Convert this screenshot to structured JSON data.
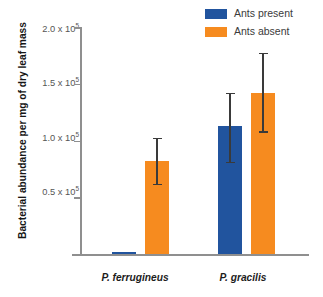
{
  "chart_data": {
    "type": "bar",
    "title": "",
    "xlabel": "",
    "ylabel": "Bacterial abundance per mg of dry leaf mass",
    "categories": [
      "P. ferrugineus",
      "P. gracilis"
    ],
    "ylim": [
      0,
      200000
    ],
    "grid": false,
    "legend_position": "top-right",
    "tick_labels": [
      "0.5 x 10⁵",
      "1.0 x 10⁵",
      "1.5 x 10⁵",
      "2.0 x 10⁵"
    ],
    "tick_values": [
      50000,
      100000,
      150000,
      200000
    ],
    "series": [
      {
        "name": "Ants present",
        "color": "#21549e",
        "values": [
          2000,
          113000
        ],
        "errors_low": [
          0,
          81000
        ],
        "errors_high": [
          0,
          142000
        ]
      },
      {
        "name": "Ants absent",
        "color": "#f68b1f",
        "values": [
          82000,
          142000
        ],
        "errors_low": [
          62000,
          108000
        ],
        "errors_high": [
          102000,
          177000
        ]
      }
    ]
  },
  "axis": {
    "tick_0": {
      "label_mantissa": "0.5 x 10",
      "label_exp": "5"
    },
    "tick_1": {
      "label_mantissa": "1.0 x 10",
      "label_exp": "5"
    },
    "tick_2": {
      "label_mantissa": "1.5 x 10",
      "label_exp": "5"
    },
    "tick_3": {
      "label_mantissa": "2.0 x 10",
      "label_exp": "5"
    }
  },
  "legend": {
    "items": [
      {
        "label": "Ants present",
        "color": "#21549e"
      },
      {
        "label": "Ants absent",
        "color": "#f68b1f"
      }
    ]
  },
  "colors": {
    "ants_present": "#21549e",
    "ants_absent": "#f68b1f",
    "axis": "#8f8f8f",
    "error_bar": "#3a3a3a",
    "background": "#ffffff"
  }
}
